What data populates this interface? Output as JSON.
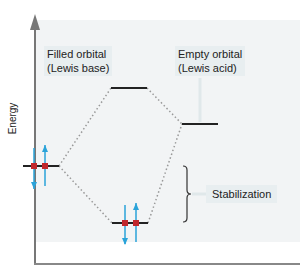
{
  "diagram": {
    "title": "",
    "axis": {
      "ylabel": "Energy"
    },
    "labels": {
      "filled_line1": "Filled orbital",
      "filled_line2": "(Lewis base)",
      "empty_line1": "Empty orbital",
      "empty_line2": "(Lewis acid)",
      "stabilization": "Stabilization"
    },
    "levels": [
      {
        "name": "filled-orbital",
        "x1": 23,
        "x2": 59,
        "y": 166,
        "electrons": 2
      },
      {
        "name": "antibonding-orbital",
        "x1": 111,
        "x2": 147,
        "y": 88,
        "electrons": 0
      },
      {
        "name": "empty-orbital",
        "x1": 182,
        "x2": 218,
        "y": 124,
        "electrons": 0
      },
      {
        "name": "bonding-orbital",
        "x1": 112,
        "x2": 148,
        "y": 223,
        "electrons": 2
      }
    ],
    "colors": {
      "axis": "#777777",
      "level": "#222222",
      "electron_arrow": "#2aa3d9",
      "electron_dot": "#c0282d",
      "dotted": "#999999",
      "label_bg": "#e8eef0"
    }
  }
}
